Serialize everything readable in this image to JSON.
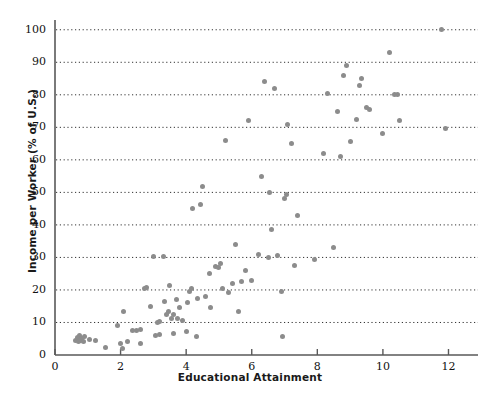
{
  "chart_data": {
    "type": "scatter",
    "title": "",
    "xlabel": "Educational Attainment",
    "ylabel": "Income per Worker (% of U.S.)",
    "xlim": [
      0,
      12.9
    ],
    "ylim": [
      0,
      103
    ],
    "xticks": [
      0,
      2,
      4,
      6,
      8,
      10,
      12
    ],
    "yticks": [
      0,
      10,
      20,
      30,
      40,
      50,
      60,
      70,
      80,
      90,
      100
    ],
    "grid": "horizontal-dotted",
    "legend": "none",
    "marker_color": "#8c8c8c",
    "axis_color": "#595959",
    "points": [
      [
        0.62,
        4.5
      ],
      [
        0.68,
        5.3
      ],
      [
        0.72,
        4.0
      ],
      [
        0.75,
        5.9
      ],
      [
        0.78,
        4.6
      ],
      [
        0.82,
        5.2
      ],
      [
        0.86,
        4.2
      ],
      [
        0.9,
        5.6
      ],
      [
        1.05,
        4.8
      ],
      [
        1.22,
        4.6
      ],
      [
        1.55,
        2.4
      ],
      [
        1.9,
        9.0
      ],
      [
        2.0,
        3.4
      ],
      [
        2.05,
        2.0
      ],
      [
        2.08,
        13.5
      ],
      [
        2.2,
        4.3
      ],
      [
        2.35,
        7.6
      ],
      [
        2.5,
        7.5
      ],
      [
        2.6,
        3.5
      ],
      [
        2.62,
        7.7
      ],
      [
        2.72,
        20.5
      ],
      [
        2.8,
        20.8
      ],
      [
        2.92,
        14.8
      ],
      [
        3.0,
        30.4
      ],
      [
        3.05,
        6.0
      ],
      [
        3.12,
        10.0
      ],
      [
        3.18,
        6.2
      ],
      [
        3.2,
        10.2
      ],
      [
        3.3,
        30.2
      ],
      [
        3.35,
        16.4
      ],
      [
        3.4,
        12.5
      ],
      [
        3.45,
        13.4
      ],
      [
        3.5,
        21.3
      ],
      [
        3.55,
        11.3
      ],
      [
        3.6,
        6.5
      ],
      [
        3.62,
        12.4
      ],
      [
        3.7,
        17.2
      ],
      [
        3.75,
        11.2
      ],
      [
        3.8,
        14.6
      ],
      [
        3.9,
        10.5
      ],
      [
        4.0,
        7.2
      ],
      [
        4.05,
        16.2
      ],
      [
        4.1,
        19.6
      ],
      [
        4.15,
        20.3
      ],
      [
        4.2,
        45.0
      ],
      [
        4.3,
        5.6
      ],
      [
        4.35,
        17.5
      ],
      [
        4.45,
        46.3
      ],
      [
        4.5,
        51.8
      ],
      [
        4.6,
        18.0
      ],
      [
        4.7,
        25.2
      ],
      [
        4.75,
        14.7
      ],
      [
        4.9,
        27.2
      ],
      [
        5.0,
        27.0
      ],
      [
        5.05,
        28.0
      ],
      [
        5.1,
        20.5
      ],
      [
        5.2,
        66.0
      ],
      [
        5.3,
        19.2
      ],
      [
        5.4,
        22.0
      ],
      [
        5.5,
        34.0
      ],
      [
        5.6,
        13.5
      ],
      [
        5.7,
        22.6
      ],
      [
        5.8,
        26.0
      ],
      [
        5.9,
        72.0
      ],
      [
        6.0,
        23.0
      ],
      [
        6.2,
        31.0
      ],
      [
        6.3,
        55.0
      ],
      [
        6.4,
        84.0
      ],
      [
        6.5,
        30.0
      ],
      [
        6.55,
        50.0
      ],
      [
        6.6,
        38.5
      ],
      [
        6.7,
        82.0
      ],
      [
        6.8,
        30.5
      ],
      [
        6.9,
        19.5
      ],
      [
        6.95,
        5.8
      ],
      [
        7.0,
        48.0
      ],
      [
        7.05,
        49.5
      ],
      [
        7.1,
        71.0
      ],
      [
        7.2,
        65.0
      ],
      [
        7.3,
        27.5
      ],
      [
        7.4,
        43.0
      ],
      [
        7.9,
        29.5
      ],
      [
        8.2,
        62.0
      ],
      [
        8.3,
        80.5
      ],
      [
        8.5,
        33.0
      ],
      [
        8.6,
        75.0
      ],
      [
        8.7,
        61.0
      ],
      [
        8.8,
        86.0
      ],
      [
        8.9,
        89.0
      ],
      [
        9.0,
        65.5
      ],
      [
        9.2,
        72.5
      ],
      [
        9.3,
        83.0
      ],
      [
        9.35,
        85.0
      ],
      [
        9.5,
        76.0
      ],
      [
        9.6,
        75.5
      ],
      [
        10.0,
        68.0
      ],
      [
        10.2,
        93.0
      ],
      [
        10.35,
        80.0
      ],
      [
        10.45,
        80.2
      ],
      [
        10.5,
        72.0
      ],
      [
        11.8,
        100.0
      ],
      [
        11.9,
        69.5
      ]
    ]
  },
  "axis": {
    "ytick_labels": [
      "0",
      "10",
      "20",
      "30",
      "40",
      "50",
      "60",
      "70",
      "80",
      "90",
      "100"
    ],
    "xtick_labels": [
      "0",
      "2",
      "4",
      "6",
      "8",
      "10",
      "12"
    ]
  }
}
